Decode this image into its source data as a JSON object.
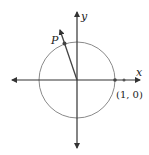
{
  "diagram": {
    "labels": {
      "x_axis": "x",
      "y_axis": "y",
      "point_p": "P",
      "point_1_0": "(1, 0)"
    },
    "colors": {
      "axis": "#333333",
      "circle": "#8a8a8a",
      "ray": "#444444",
      "text": "#222222"
    }
  }
}
